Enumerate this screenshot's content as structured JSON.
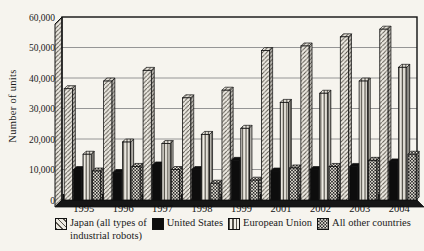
{
  "colors": {
    "ink": "#111111",
    "grid": "#8a8a8a",
    "paper": "#f6f4ee",
    "bar_black": "#0d0d0d"
  },
  "legend": {
    "items": [
      {
        "line1": "Japan (all types of",
        "line2": "industrial robots)",
        "swatch": "diagonal-hatch"
      },
      {
        "line1": "United States",
        "line2": "",
        "swatch": "solid-black"
      },
      {
        "line1": "European Union",
        "line2": "",
        "swatch": "vertical-stripes"
      },
      {
        "line1": "All other countries",
        "line2": "",
        "swatch": "checker-dots"
      }
    ]
  },
  "chart_data": {
    "type": "bar",
    "title": "",
    "xlabel": "",
    "ylabel": "Number of units",
    "categories": [
      "1995",
      "1996",
      "1997",
      "1998",
      "1999",
      "2001",
      "2002",
      "2003",
      "2004"
    ],
    "series": [
      {
        "name": "Japan (all types of industrial robots)",
        "pattern": "diagonal-hatch",
        "values": [
          36500,
          39000,
          42500,
          33500,
          36000,
          49000,
          50500,
          53500,
          56000
        ]
      },
      {
        "name": "United States",
        "pattern": "solid-black",
        "values": [
          10000,
          9000,
          11500,
          10000,
          13000,
          9500,
          10000,
          11000,
          12500
        ]
      },
      {
        "name": "European Union",
        "pattern": "vertical-stripes",
        "values": [
          15000,
          19000,
          18500,
          21500,
          23500,
          32000,
          35000,
          39000,
          43500
        ]
      },
      {
        "name": "All other countries",
        "pattern": "checker-dots",
        "values": [
          9500,
          11000,
          10000,
          5500,
          6500,
          10500,
          11000,
          13000,
          15000
        ]
      }
    ],
    "ylim": [
      0,
      60000
    ],
    "yticks": [
      0,
      10000,
      20000,
      30000,
      40000,
      50000,
      60000
    ],
    "ytick_labels": [
      "0",
      "10,000",
      "20,000",
      "30,000",
      "40,000",
      "50,000",
      "60,000"
    ],
    "grid": true,
    "legend_position": "bottom",
    "style": "3d-column-chart-scanned-print"
  }
}
